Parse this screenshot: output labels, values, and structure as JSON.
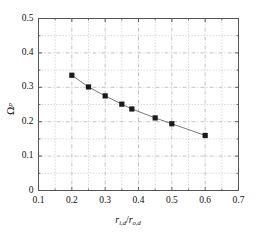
{
  "chart_data": {
    "type": "line",
    "title": "",
    "subtitle": "",
    "xlabel": "r_i,d / r_o,d",
    "ylabel": "Ω_p",
    "xlabel_parts": {
      "num_sym": "r",
      "num_sub": "i,d",
      "slash": "/",
      "den_sym": "r",
      "den_sub": "o,d"
    },
    "ylabel_parts": {
      "sym": "Ω",
      "sub": "p"
    },
    "xlim": [
      0.1,
      0.7
    ],
    "ylim": [
      0.0,
      0.5
    ],
    "xticks": [
      0.1,
      0.2,
      0.3,
      0.4,
      0.5,
      0.6,
      0.7
    ],
    "yticks": [
      0,
      0.1,
      0.2,
      0.3,
      0.4,
      0.5
    ],
    "xtick_labels": [
      "0.1",
      "0.2",
      "0.3",
      "0.4",
      "0.5",
      "0.6",
      "0.7"
    ],
    "ytick_labels": [
      "0",
      "0.1",
      "0.2",
      "0.3",
      "0.4",
      "0.5"
    ],
    "minor_tick_step_x": 0.05,
    "minor_tick_step_y": 0.05,
    "grid": true,
    "grid_style": "dashed",
    "grid_color": "#b4b4b4",
    "axis_color": "#555555",
    "legend": null,
    "legend_position": "none",
    "series": [
      {
        "name": "",
        "marker": "filled-square",
        "marker_color": "#1a1a1a",
        "line_color": "#6a6a6a",
        "x": [
          0.2,
          0.25,
          0.3,
          0.35,
          0.38,
          0.45,
          0.5,
          0.6
        ],
        "y": [
          0.335,
          0.301,
          0.275,
          0.251,
          0.237,
          0.211,
          0.194,
          0.16
        ]
      }
    ]
  }
}
